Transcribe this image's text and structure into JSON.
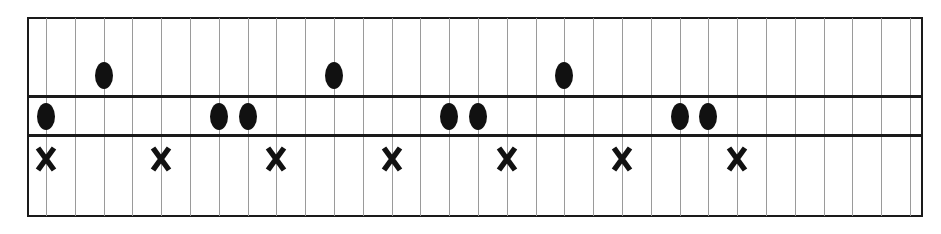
{
  "diagram": {
    "type": "rhythm-grid",
    "columns": 31,
    "rows": [
      {
        "name": "top",
        "marker": "dot",
        "positions": [
          2,
          10,
          18
        ]
      },
      {
        "name": "middle",
        "marker": "dot",
        "positions": [
          0,
          6,
          7,
          14,
          15,
          22,
          23
        ]
      },
      {
        "name": "bottom",
        "marker": "x",
        "positions": [
          0,
          4,
          8,
          12,
          16,
          20,
          24
        ]
      }
    ],
    "colors": {
      "ink": "#111111",
      "grid": "#9a9a9a",
      "frame": "#1a1a1a",
      "background": "#ffffff"
    }
  }
}
